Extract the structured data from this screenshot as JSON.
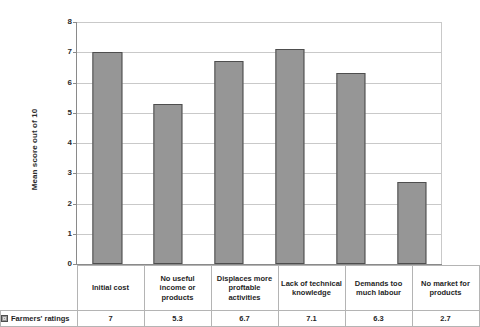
{
  "chart_data": {
    "type": "bar",
    "title": "",
    "xlabel": "",
    "ylabel": "Mean score out of 10",
    "ylim": [
      0,
      8
    ],
    "yticks": [
      0,
      1,
      2,
      3,
      4,
      5,
      6,
      7,
      8
    ],
    "grid": true,
    "legend_position": "bottom-left-table",
    "categories": [
      "Initial cost",
      "No useful income or products",
      "Displaces more proftable activities",
      "Lack of technical knowledge",
      "Demands too much labour",
      "No market for products"
    ],
    "series": [
      {
        "name": "Farmers' ratings",
        "values": [
          7,
          5.3,
          6.7,
          7.1,
          6.3,
          2.7
        ],
        "color": "#969696"
      }
    ],
    "value_labels": [
      "7",
      "5.3",
      "6.7",
      "7.1",
      "6.3",
      "2.7"
    ]
  },
  "axis": {
    "y_title": "Mean score out of 10",
    "y_tick_labels": [
      "0",
      "1",
      "2",
      "3",
      "4",
      "5",
      "6",
      "7",
      "8"
    ]
  },
  "table": {
    "legend_label": "Farmers' ratings",
    "legend_swatch_name": "series-swatch",
    "category_row": [
      "Initial cost",
      "No useful income or products",
      "Displaces more proftable activities",
      "Lack of technical knowledge",
      "Demands too much labour",
      "No market for products"
    ],
    "value_row": [
      "7",
      "5.3",
      "6.7",
      "7.1",
      "6.3",
      "2.7"
    ]
  },
  "colors": {
    "bar_fill": "#969696",
    "bar_stroke": "#4e4e4e",
    "gridline": "#c9c9c9",
    "axis": "#8a8a8a",
    "table_border": "#b4b4b4",
    "background": "#ffffff"
  }
}
